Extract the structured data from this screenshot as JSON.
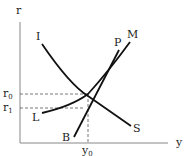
{
  "diagram": {
    "type": "economics-graph",
    "axes": {
      "vertical_label": "r",
      "horizontal_label": "y"
    },
    "curves": [
      {
        "id": "IS",
        "start_label": "I",
        "end_label": "S",
        "shape": "downward-sloping convex"
      },
      {
        "id": "LM",
        "start_label": "L",
        "end_label": "M",
        "shape": "upward-sloping convex"
      },
      {
        "id": "BP",
        "start_label": "B",
        "end_label": "P",
        "shape": "upward-sloping steep line"
      }
    ],
    "levels": {
      "r0": {
        "base": "r",
        "sub": "0"
      },
      "r1": {
        "base": "r",
        "sub": "1"
      },
      "y0": {
        "base": "y",
        "sub": "0"
      }
    },
    "colors": {
      "curve": "#111111",
      "axis": "#888888",
      "dashed": "#555555",
      "background": "#ffffff"
    }
  }
}
